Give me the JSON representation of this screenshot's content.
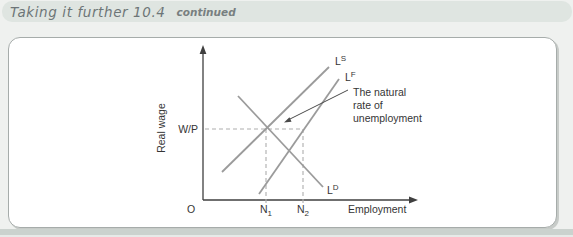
{
  "header": {
    "title": "Taking it further 10.4",
    "continued_label": "continued"
  },
  "figure": {
    "y_axis_label": "Real wage",
    "x_axis_label": "Employment",
    "origin_label": "O",
    "wage_level_label": "W/P",
    "curve_labels": {
      "supply": {
        "base": "L",
        "sup": "S"
      },
      "labour_force": {
        "base": "L",
        "sup": "F"
      },
      "demand": {
        "base": "L",
        "sup": "D"
      }
    },
    "x_tick_labels": {
      "n1": {
        "base": "N",
        "sub": "1"
      },
      "n2": {
        "base": "N",
        "sub": "2"
      }
    },
    "annotation": {
      "line1": "The natural",
      "line2": "rate of",
      "line3": "unemployment"
    },
    "colors": {
      "page_bg": "#eff1ef",
      "header_bg": "#dfe5e1",
      "header_text": "#6d7577",
      "panel_bg": "#ffffff",
      "panel_border": "#a6acaa",
      "bottom_band": "#cbd2ce",
      "curve": "#9b9b9b",
      "dashed": "#aeaeae",
      "axis": "#3f3f3f",
      "arrow": "#4a4a4a",
      "text": "#353535"
    }
  }
}
